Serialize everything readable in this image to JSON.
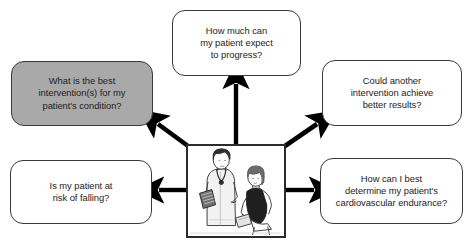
{
  "diagram": {
    "layout": "hub-and-spoke",
    "center": {
      "name": "patient-examination-illustration",
      "description": "Line drawing of a clinician holding a clipboard and wearing a stethoscope examining a seated patient",
      "border_color": "#2b2b2b"
    },
    "colors": {
      "box_border": "#3a3a3a",
      "box_fill": "#ffffff",
      "highlight_fill": "#a9a9a9",
      "arrow": "#000000",
      "text": "#1d1d1d"
    },
    "boxes": [
      {
        "id": "box-progress",
        "text": "How much can\nmy patient expect\nto progress?",
        "highlighted": false,
        "direction": "up"
      },
      {
        "id": "box-best-intervention",
        "text": "What is the best\nintervention(s) for my\npatient's condition?",
        "highlighted": true,
        "direction": "up-left"
      },
      {
        "id": "box-another-intervention",
        "text": "Could another\nintervention achieve\nbetter results?",
        "highlighted": false,
        "direction": "up-right"
      },
      {
        "id": "box-falling",
        "text": "Is my patient at\nrisk of falling?",
        "highlighted": false,
        "direction": "left"
      },
      {
        "id": "box-cardio",
        "text": "How can I best\ndetermine my patient's\ncardiovascular endurance?",
        "highlighted": false,
        "direction": "right"
      }
    ],
    "arrows": [
      {
        "id": "arrow-up",
        "from": "center",
        "to": "box-progress"
      },
      {
        "id": "arrow-up-left",
        "from": "center",
        "to": "box-best-intervention"
      },
      {
        "id": "arrow-up-right",
        "from": "center",
        "to": "box-another-intervention"
      },
      {
        "id": "arrow-left",
        "from": "center",
        "to": "box-falling"
      },
      {
        "id": "arrow-right",
        "from": "center",
        "to": "box-cardio"
      }
    ]
  }
}
